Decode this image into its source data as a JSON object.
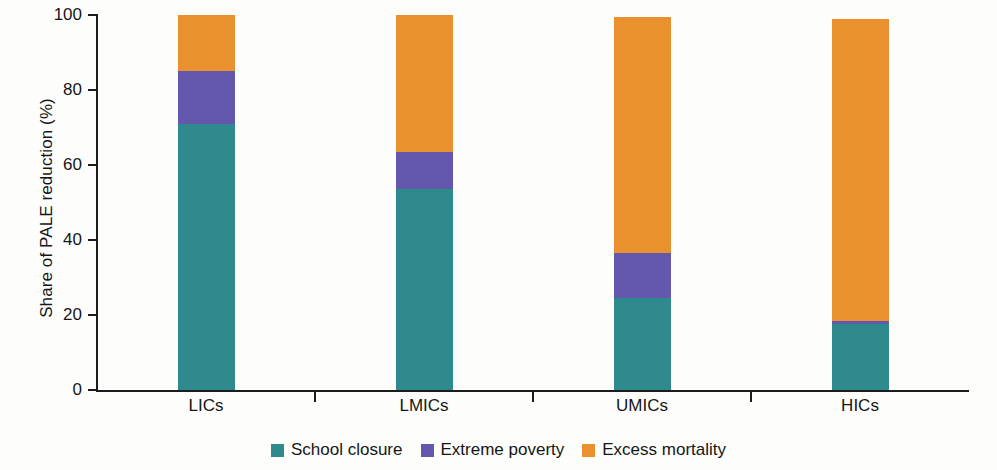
{
  "chart_data": {
    "type": "bar",
    "subtype": "stacked-100-percent",
    "title": "",
    "subtitle": "",
    "xlabel": "",
    "ylabel": "Share of PALE reduction (%)",
    "categories": [
      "LICs",
      "LMICs",
      "UMICs",
      "HICs"
    ],
    "ylim": [
      0,
      100
    ],
    "yticks": [
      0,
      20,
      40,
      60,
      80,
      100
    ],
    "ytick_labels": [
      "0",
      "20",
      "40",
      "60",
      "80",
      "100"
    ],
    "grid": false,
    "legend_position": "bottom-center",
    "series": [
      {
        "name": "School closure",
        "color": "#2E8A8D",
        "values": [
          71.0,
          53.5,
          24.5,
          17.5
        ]
      },
      {
        "name": "Extreme poverty",
        "color": "#6358AE",
        "values": [
          14.0,
          10.0,
          12.0,
          1.0
        ]
      },
      {
        "name": "Excess mortality",
        "color": "#E8912E",
        "values": [
          15.0,
          36.5,
          63.0,
          80.5
        ]
      }
    ],
    "totals": [
      100.0,
      100.0,
      99.5,
      99.0
    ]
  },
  "axis": {
    "y_title": "Share of PALE reduction (%)"
  },
  "legend": {
    "items": [
      {
        "label": "School closure",
        "color": "#2E8A8D"
      },
      {
        "label": "Extreme poverty",
        "color": "#6358AE"
      },
      {
        "label": "Excess mortality",
        "color": "#E8912E"
      }
    ]
  }
}
